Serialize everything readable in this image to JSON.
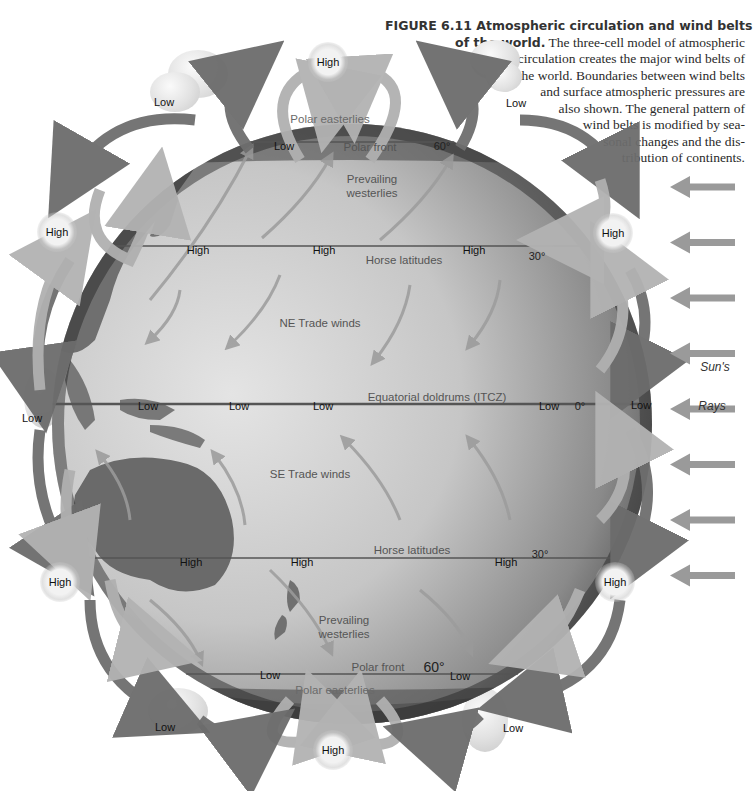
{
  "caption": {
    "figure_number": "FIGURE 6.11",
    "title": "Atmospheric circulation and wind belts of the world.",
    "lines": [
      {
        "bold": "FIGURE 6.11  Atmospheric circulation and wind belts",
        "text": ""
      },
      {
        "bold": "of the world.",
        "text": " The three-cell model of atmospheric"
      },
      {
        "bold": "",
        "text": "circulation creates the major wind belts of"
      },
      {
        "bold": "",
        "text": "the world. Boundaries between wind belts"
      },
      {
        "bold": "",
        "text": "and surface atmospheric pressures are"
      },
      {
        "bold": "",
        "text": "also shown. The general pattern of"
      },
      {
        "bold": "",
        "text": "wind belts is modified by sea-"
      },
      {
        "bold": "",
        "text": "sonal changes and the dis-"
      },
      {
        "bold": "",
        "text": "tribution of continents."
      }
    ]
  },
  "globe": {
    "colors": {
      "ocean_light": "#d9d9d9",
      "ocean_dark": "#3a3a3a",
      "land": "#7a7a7a",
      "latitude_line": "#555555",
      "cell_arrow_light": "#b0b0b0",
      "cell_arrow_dark": "#6e6e6e",
      "sun_arrow": "#9a9a9a"
    },
    "latitude_lines": [
      {
        "name": "polar-front-north",
        "degree": "60°",
        "label": "Polar front"
      },
      {
        "name": "horse-latitudes-north",
        "degree": "30°",
        "label": "Horse latitudes"
      },
      {
        "name": "equator",
        "degree": "0°",
        "label": "Equatorial doldrums (ITCZ)"
      },
      {
        "name": "horse-latitudes-south",
        "degree": "30°",
        "label": "Horse latitudes"
      },
      {
        "name": "polar-front-south",
        "degree": "60°",
        "label": "Polar front"
      }
    ],
    "wind_belts": {
      "polar_easterlies_north": "Polar easterlies",
      "westerlies_north": "Prevailing\nwesterlies",
      "ne_trades": "NE Trade winds",
      "se_trades": "SE Trade winds",
      "westerlies_south": "Prevailing\nwesterlies",
      "polar_easterlies_south": "Polar easterlies"
    },
    "surface_pressure_labels": {
      "north_60": [
        "Low"
      ],
      "north_30": [
        "High",
        "High",
        "High"
      ],
      "equator": [
        "Low",
        "Low",
        "Low",
        "Low"
      ],
      "south_30": [
        "High",
        "High",
        "High"
      ],
      "south_60": [
        "Low",
        "Low"
      ]
    }
  },
  "pressure_badges": {
    "north_pole": "High",
    "south_pole": "High",
    "left_north_30": "High",
    "right_north_30": "High",
    "left_south_30": "High",
    "right_south_30": "High"
  },
  "cloud_labels": {
    "north_left": "Low",
    "north_right": "Low",
    "equator_left": "Low",
    "equator_right": "Low",
    "south_left": "Low",
    "south_right": "Low"
  },
  "sun_rays": {
    "label_top": "Sun's",
    "label_bottom": "Rays",
    "arrow_count": 8
  }
}
